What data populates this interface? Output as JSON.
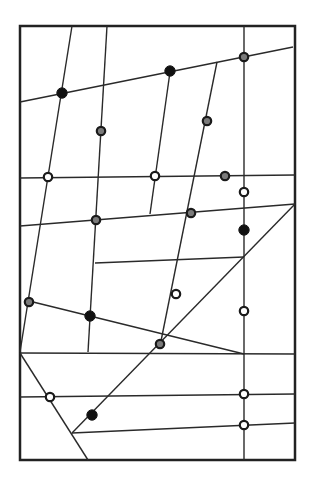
{
  "diagram": {
    "title": "",
    "frame": {
      "x": 20,
      "y": 26,
      "width": 275,
      "height": 434,
      "stroke": "#222222"
    },
    "colors": {
      "line": "#2a2a2a",
      "node_black": "#111111",
      "node_gray": "#7a7a7a",
      "node_white": "#ffffff",
      "node_stroke": "#1a1a1a"
    },
    "lines": [
      {
        "id": "top-slant",
        "x1": 20,
        "y1": 102,
        "x2": 293,
        "y2": 47
      },
      {
        "id": "left-long",
        "x1": 72,
        "y1": 26,
        "x2": 20,
        "y2": 352
      },
      {
        "id": "line-b",
        "x1": 107,
        "y1": 26,
        "x2": 88,
        "y2": 352
      },
      {
        "id": "line-c-upper",
        "x1": 170,
        "y1": 72,
        "x2": 150,
        "y2": 214
      },
      {
        "id": "line-d",
        "x1": 217,
        "y1": 62,
        "x2": 160,
        "y2": 346
      },
      {
        "id": "vertical-right",
        "x1": 244,
        "y1": 26,
        "x2": 244,
        "y2": 460
      },
      {
        "id": "h-177",
        "x1": 20,
        "y1": 178,
        "x2": 295,
        "y2": 175
      },
      {
        "id": "h-226",
        "x1": 20,
        "y1": 226,
        "x2": 295,
        "y2": 204
      },
      {
        "id": "h-263",
        "x1": 95,
        "y1": 263,
        "x2": 244,
        "y2": 257
      },
      {
        "id": "diagonal",
        "x1": 295,
        "y1": 204,
        "x2": 72,
        "y2": 433
      },
      {
        "id": "h-352",
        "x1": 20,
        "y1": 353,
        "x2": 295,
        "y2": 354
      },
      {
        "id": "slant-bottom-left",
        "x1": 20,
        "y1": 353,
        "x2": 88,
        "y2": 460
      },
      {
        "id": "slant-302",
        "x1": 29,
        "y1": 301,
        "x2": 244,
        "y2": 354
      },
      {
        "id": "h-397",
        "x1": 20,
        "y1": 397,
        "x2": 295,
        "y2": 394
      },
      {
        "id": "h-433",
        "x1": 72,
        "y1": 433,
        "x2": 295,
        "y2": 423
      }
    ],
    "nodes": [
      {
        "id": "n1",
        "x": 62,
        "y": 93,
        "type": "black"
      },
      {
        "id": "n2",
        "x": 170,
        "y": 71,
        "type": "black"
      },
      {
        "id": "n3",
        "x": 244,
        "y": 57,
        "type": "gray"
      },
      {
        "id": "n4",
        "x": 101,
        "y": 131,
        "type": "gray"
      },
      {
        "id": "n5",
        "x": 207,
        "y": 121,
        "type": "gray"
      },
      {
        "id": "n6",
        "x": 48,
        "y": 177,
        "type": "white"
      },
      {
        "id": "n7",
        "x": 155,
        "y": 176,
        "type": "white"
      },
      {
        "id": "n8",
        "x": 225,
        "y": 176,
        "type": "gray"
      },
      {
        "id": "n9",
        "x": 244,
        "y": 192,
        "type": "white"
      },
      {
        "id": "n10",
        "x": 96,
        "y": 220,
        "type": "gray"
      },
      {
        "id": "n11",
        "x": 191,
        "y": 213,
        "type": "gray"
      },
      {
        "id": "n12",
        "x": 244,
        "y": 230,
        "type": "black"
      },
      {
        "id": "n13",
        "x": 176,
        "y": 294,
        "type": "white"
      },
      {
        "id": "n14",
        "x": 29,
        "y": 302,
        "type": "gray"
      },
      {
        "id": "n15",
        "x": 90,
        "y": 316,
        "type": "black"
      },
      {
        "id": "n16",
        "x": 244,
        "y": 311,
        "type": "white"
      },
      {
        "id": "n17",
        "x": 160,
        "y": 344,
        "type": "gray"
      },
      {
        "id": "n18",
        "x": 50,
        "y": 397,
        "type": "white"
      },
      {
        "id": "n19",
        "x": 244,
        "y": 394,
        "type": "white"
      },
      {
        "id": "n20",
        "x": 92,
        "y": 415,
        "type": "black"
      },
      {
        "id": "n21",
        "x": 244,
        "y": 425,
        "type": "white"
      }
    ],
    "legend": {
      "black": "filled node",
      "gray": "gray node",
      "white": "hollow node"
    }
  }
}
